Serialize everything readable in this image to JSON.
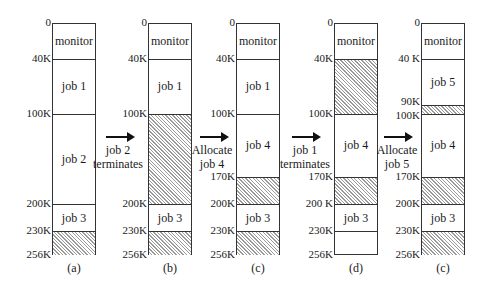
{
  "chart_data": {
    "type": "diagram",
    "units": "K",
    "total_memory": 256,
    "states": [
      {
        "caption": "(a)",
        "ticks": [
          "0",
          "40K",
          "100K",
          "200K",
          "230K",
          "256K"
        ],
        "segments": [
          {
            "start": 0,
            "end": 40,
            "label": "monitor",
            "free": false
          },
          {
            "start": 40,
            "end": 100,
            "label": "job 1",
            "free": false
          },
          {
            "start": 100,
            "end": 200,
            "label": "job 2",
            "free": false
          },
          {
            "start": 200,
            "end": 230,
            "label": "job 3",
            "free": false
          },
          {
            "start": 230,
            "end": 256,
            "label": "",
            "free": true
          }
        ]
      },
      {
        "caption": "(b)",
        "ticks": [
          "0",
          "40K",
          "100K",
          "200K",
          "230K",
          "256K"
        ],
        "segments": [
          {
            "start": 0,
            "end": 40,
            "label": "monitor",
            "free": false
          },
          {
            "start": 40,
            "end": 100,
            "label": "job 1",
            "free": false
          },
          {
            "start": 100,
            "end": 200,
            "label": "",
            "free": true
          },
          {
            "start": 200,
            "end": 230,
            "label": "job 3",
            "free": false
          },
          {
            "start": 230,
            "end": 256,
            "label": "",
            "free": true
          }
        ]
      },
      {
        "caption": "(c)",
        "ticks": [
          "0",
          "40K",
          "100K",
          "170K",
          "200K",
          "230K",
          "256K"
        ],
        "segments": [
          {
            "start": 0,
            "end": 40,
            "label": "monitor",
            "free": false
          },
          {
            "start": 40,
            "end": 100,
            "label": "job 1",
            "free": false
          },
          {
            "start": 100,
            "end": 170,
            "label": "job 4",
            "free": false
          },
          {
            "start": 170,
            "end": 200,
            "label": "",
            "free": true
          },
          {
            "start": 200,
            "end": 230,
            "label": "job 3",
            "free": false
          },
          {
            "start": 230,
            "end": 256,
            "label": "",
            "free": true
          }
        ]
      },
      {
        "caption": "(d)",
        "ticks": [
          "0",
          "40K",
          "100K",
          "170K",
          "200 K",
          "230K",
          "256K"
        ],
        "segments": [
          {
            "start": 0,
            "end": 40,
            "label": "monitor",
            "free": false
          },
          {
            "start": 40,
            "end": 100,
            "label": "",
            "free": true
          },
          {
            "start": 100,
            "end": 170,
            "label": "job 4",
            "free": false
          },
          {
            "start": 170,
            "end": 200,
            "label": "",
            "free": true
          },
          {
            "start": 200,
            "end": 230,
            "label": "job 3",
            "free": false
          },
          {
            "start": 230,
            "end": 256,
            "label": "",
            "free": false
          }
        ]
      },
      {
        "caption": "(c)",
        "ticks": [
          "0",
          "40 K",
          "90K",
          "100K",
          "170K",
          "200K",
          "230K",
          "256K"
        ],
        "segments": [
          {
            "start": 0,
            "end": 40,
            "label": "monitor",
            "free": false
          },
          {
            "start": 40,
            "end": 90,
            "label": "job 5",
            "free": false
          },
          {
            "start": 90,
            "end": 100,
            "label": "",
            "free": true
          },
          {
            "start": 100,
            "end": 170,
            "label": "job 4",
            "free": false
          },
          {
            "start": 170,
            "end": 200,
            "label": "",
            "free": true
          },
          {
            "start": 200,
            "end": 230,
            "label": "job 3",
            "free": false
          },
          {
            "start": 230,
            "end": 256,
            "label": "",
            "free": true
          }
        ]
      }
    ],
    "transitions": [
      {
        "line1": "job 2",
        "line2": "terminates"
      },
      {
        "line1": "Allocate",
        "line2": "job 4"
      },
      {
        "line1": "job 1",
        "line2": "terminates"
      },
      {
        "line1": "Allocate",
        "line2": "job 5"
      }
    ]
  }
}
